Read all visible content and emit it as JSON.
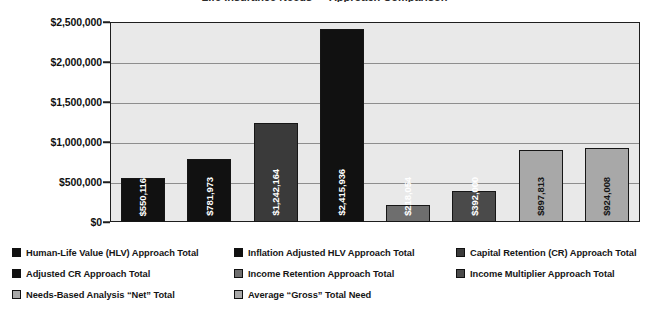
{
  "chart_data": {
    "type": "bar",
    "title": "Life Insurance Needs — Approach Comparison",
    "xlabel": "",
    "ylabel": "",
    "ylim": [
      0,
      2500000
    ],
    "grid": true,
    "legend_position": "bottom",
    "orientation": "vertical",
    "categories": [
      "Human-Life Value (HLV) Approach Total",
      "Inflation Adjusted HLV Approach Total",
      "Capital Retention (CR) Approach Total",
      "Adjusted CR Approach Total",
      "Income Retention Approach Total",
      "Income Multiplier Approach Total",
      "Needs-Based Analysis “Net” Total",
      "Average “Gross” Total Need"
    ],
    "values": [
      550116,
      781973,
      1242164,
      2415936,
      218054,
      392000,
      897813,
      924008
    ],
    "data_labels": [
      "$550,116",
      "$781,973",
      "$1,242,164",
      "$2,415,936",
      "$218,054",
      "$392,000",
      "$897,813",
      "$924,008"
    ],
    "bar_colors": [
      "#111111",
      "#111111",
      "#3a3a3a",
      "#111111",
      "#6e6e6e",
      "#4a4a4a",
      "#a8a8a8",
      "#a8a8a8"
    ],
    "label_colors": [
      "light",
      "light",
      "light",
      "light",
      "light",
      "light",
      "dark",
      "dark"
    ],
    "yticks": [
      0,
      500000,
      1000000,
      1500000,
      2000000,
      2500000
    ],
    "ytick_labels": [
      "$0",
      "$500,000",
      "$1,000,000",
      "$1,500,000",
      "$2,000,000",
      "$2,500,000"
    ],
    "plot_background": "#e9e9e9",
    "axis_color": "#1e1e1e",
    "gridline_color": "#8e8e8e"
  },
  "legend": {
    "columns": [
      [
        {
          "label": "Human-Life Value (HLV) Approach Total",
          "color": "#111111"
        },
        {
          "label": "Adjusted CR Approach Total",
          "color": "#111111"
        },
        {
          "label": "Needs-Based Analysis “Net” Total",
          "color": "#a8a8a8"
        }
      ],
      [
        {
          "label": "Inflation Adjusted HLV Approach Total",
          "color": "#111111"
        },
        {
          "label": "Income Retention Approach Total",
          "color": "#6e6e6e"
        },
        {
          "label": "Average “Gross” Total Need",
          "color": "#a8a8a8"
        }
      ],
      [
        {
          "label": "Capital Retention (CR) Approach Total",
          "color": "#3a3a3a"
        },
        {
          "label": "Income Multiplier Approach Total",
          "color": "#4a4a4a"
        }
      ]
    ]
  }
}
